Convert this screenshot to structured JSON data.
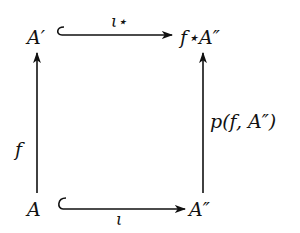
{
  "diagram": {
    "type": "commutative-square",
    "nodes": {
      "top_left": "A′",
      "top_right": "f⋆A″",
      "bottom_left": "A",
      "bottom_right": "A″"
    },
    "arrows": {
      "top": {
        "label": "ι⋆",
        "from": "A′",
        "to": "f⋆A″",
        "kind": "inclusion"
      },
      "bottom": {
        "label": "ι",
        "from": "A",
        "to": "A″",
        "kind": "inclusion"
      },
      "left": {
        "label": "f",
        "from": "A",
        "to": "A′"
      },
      "right": {
        "label": "p(f, A″)",
        "from": "A″",
        "to": "f⋆A″"
      }
    },
    "color": "#111111"
  }
}
